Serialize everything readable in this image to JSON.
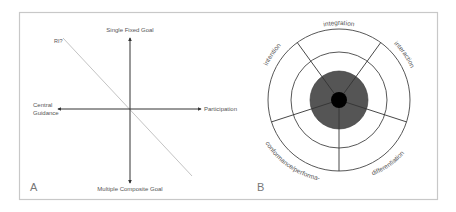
{
  "panel_a": {
    "letter": "A",
    "axes": {
      "top": "Single Fixed Goal",
      "bottom": "Multiple Composite Goal",
      "left_line1": "Central",
      "left_line2": "Guidance",
      "right": "Participation"
    },
    "diagonal_label": "RI?"
  },
  "panel_b": {
    "letter": "B",
    "segments": {
      "top": "integration",
      "upper_right": "interaction",
      "lower_right": "differentiation",
      "lower_left": "conformance/performa-",
      "upper_left": "intention"
    },
    "colors": {
      "core": "#000000",
      "inner_disc": "#555555",
      "rings": "#444444"
    }
  }
}
